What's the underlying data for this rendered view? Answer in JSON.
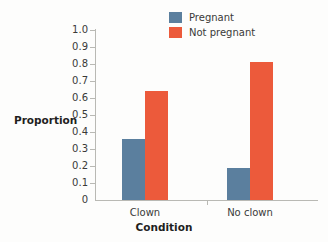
{
  "chart_data": {
    "type": "bar",
    "title": "",
    "xlabel": "Condition",
    "ylabel": "Proportion",
    "categories": [
      "Clown",
      "No clown"
    ],
    "series": [
      {
        "name": "Pregnant",
        "values": [
          0.36,
          0.19
        ],
        "color": "#5b7f9e"
      },
      {
        "name": "Not pregnant",
        "values": [
          0.64,
          0.81
        ],
        "color": "#ec5a3b"
      }
    ],
    "ylim": [
      0,
      1.0
    ],
    "ytick_labels": [
      "1.0",
      "0.9",
      "0.8",
      "0.7",
      "0.6",
      "0.5",
      "0.4",
      "0.3",
      "0.2",
      "0.1",
      "0"
    ],
    "ytick_values": [
      1.0,
      0.9,
      0.8,
      0.7,
      0.6,
      0.5,
      0.4,
      0.3,
      0.2,
      0.1,
      0
    ],
    "grid": false,
    "legend_position": "top-center",
    "axis_color": "#b9b9b4",
    "text_color": "#3a3a38",
    "background": "#fdfdfc"
  },
  "legend": {
    "entries": [
      {
        "label": "Pregnant",
        "color": "#5b7f9e"
      },
      {
        "label": "Not pregnant",
        "color": "#ec5a3b"
      }
    ]
  },
  "axes": {
    "y_title": "Proportion",
    "x_title": "Condition",
    "y_ticks": [
      "1.0",
      "0.9",
      "0.8",
      "0.7",
      "0.6",
      "0.5",
      "0.4",
      "0.3",
      "0.2",
      "0.1",
      "0"
    ],
    "x_ticks": [
      "Clown",
      "No clown"
    ]
  }
}
